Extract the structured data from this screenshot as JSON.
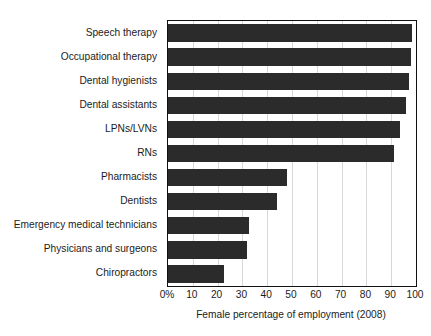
{
  "figure": {
    "title_remnant": "",
    "background_color": "#ffffff",
    "bar_color": "#2b2b2b",
    "grid_color": "#d8d8d8",
    "axis_color": "#111111"
  },
  "chart_data": {
    "type": "bar",
    "orientation": "horizontal",
    "title": "",
    "xlabel": "Female percentage of employment (2008)",
    "ylabel": "",
    "xlim": [
      0,
      100
    ],
    "grid": true,
    "legend": "none",
    "xtick_labels": [
      "0%",
      "10",
      "20",
      "30",
      "40",
      "50",
      "60",
      "70",
      "80",
      "90",
      "100"
    ],
    "xticks": [
      0,
      10,
      20,
      30,
      40,
      50,
      60,
      70,
      80,
      90,
      100
    ],
    "categories": [
      "Speech therapy",
      "Occupational therapy",
      "Dental hygienists",
      "Dental assistants",
      "LPNs/LVNs",
      "RNs",
      "Pharmacists",
      "Dentists",
      "Emergency medical technicians",
      "Physicians and surgeons",
      "Chiropractors"
    ],
    "values": [
      98.5,
      98,
      97,
      96,
      93.5,
      91,
      48,
      44,
      32.5,
      32,
      22.5
    ]
  }
}
